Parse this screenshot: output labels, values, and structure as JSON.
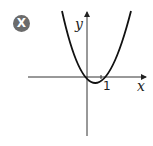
{
  "badge": {
    "label": "X",
    "color": "#6b6b6b"
  },
  "axes": {
    "x_label": "x",
    "y_label": "y",
    "tick_label": "1",
    "color": "#222222"
  },
  "curve": {
    "description": "upward parabola through origin and x=1",
    "equation": "y = x^2 - x",
    "color": "#111111"
  }
}
